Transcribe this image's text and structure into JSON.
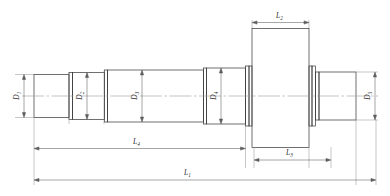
{
  "drawing": {
    "title": "Stepped shaft engineering drawing",
    "type": "mechanical-part-outline",
    "view": "front-section-view",
    "line_color": "#333333",
    "centerline_color": "#8a8a8a",
    "background": "#ffffff"
  },
  "diameters": [
    {
      "id": "D1",
      "text": "D",
      "sub": "1",
      "orientation": "vertical",
      "x": 19,
      "y": 96,
      "segment": "leftmost-journal"
    },
    {
      "id": "D2",
      "text": "D",
      "sub": "2",
      "orientation": "vertical",
      "x": 82,
      "y": 96,
      "segment": "second-step"
    },
    {
      "id": "D3",
      "text": "D",
      "sub": "3",
      "orientation": "vertical",
      "x": 137,
      "y": 96,
      "segment": "third-step"
    },
    {
      "id": "D4",
      "text": "D",
      "sub": "4",
      "orientation": "vertical",
      "x": 216,
      "y": 96,
      "segment": "fourth-step"
    },
    {
      "id": "D5",
      "text": "D",
      "sub": "5",
      "orientation": "vertical",
      "x": 371,
      "y": 96,
      "segment": "right-journal"
    }
  ],
  "lengths": [
    {
      "id": "L2",
      "text": "L",
      "sub": "2",
      "orientation": "horizontal",
      "x": 289,
      "y": 15,
      "position": "top",
      "span": "collar-width"
    },
    {
      "id": "L4",
      "text": "L",
      "sub": "4",
      "orientation": "horizontal",
      "x": 139,
      "y": 140,
      "position": "bottom-upper",
      "span": "left-end-to-collar"
    },
    {
      "id": "L3",
      "text": "L",
      "sub": "3",
      "orientation": "horizontal",
      "x": 290,
      "y": 152,
      "position": "bottom-upper-right",
      "span": "collar-right-to-step"
    },
    {
      "id": "L1",
      "text": "L",
      "sub": "1",
      "orientation": "horizontal",
      "x": 189,
      "y": 172,
      "position": "bottom",
      "span": "overall-length"
    }
  ]
}
